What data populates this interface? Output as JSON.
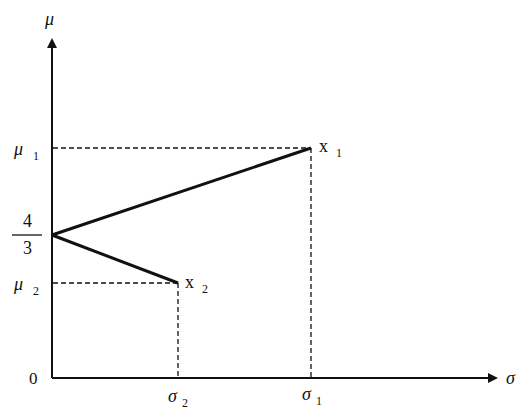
{
  "diagram": {
    "type": "mean-std plot",
    "axes": {
      "y_label": "μ",
      "x_label": "σ",
      "origin_label": "0"
    },
    "y_ticks": [
      {
        "label": "μ",
        "sub": "1"
      },
      {
        "label_num": "4",
        "label_den": "3"
      },
      {
        "label": "μ",
        "sub": "2"
      }
    ],
    "x_ticks": [
      {
        "label": "σ",
        "sub": "2"
      },
      {
        "label": "σ",
        "sub": "1"
      }
    ],
    "points": [
      {
        "label": "x",
        "sub": "1"
      },
      {
        "label": "x",
        "sub": "2"
      }
    ],
    "colors": {
      "line": "#111111",
      "background": "#ffffff"
    }
  }
}
